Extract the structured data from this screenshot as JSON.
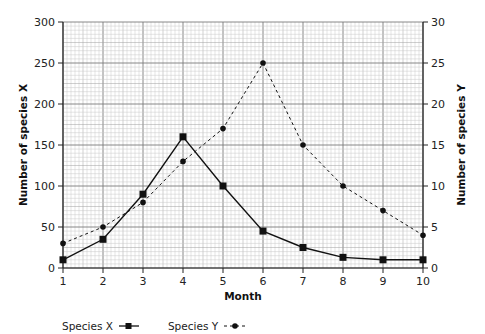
{
  "chart_data": {
    "type": "line",
    "title": "",
    "xlabel": "Month",
    "ylabel": "Number of species X",
    "ylabel_right": "Number of species Y",
    "x": [
      1,
      2,
      3,
      4,
      5,
      6,
      7,
      8,
      9,
      10
    ],
    "xlim": [
      1,
      10
    ],
    "ylim": [
      0,
      300
    ],
    "ylim_right": [
      0,
      30
    ],
    "x_ticks": [
      "1",
      "2",
      "3",
      "4",
      "5",
      "6",
      "7",
      "8",
      "9",
      "10"
    ],
    "y_ticks_left": [
      "0",
      "50",
      "100",
      "150",
      "200",
      "250",
      "300"
    ],
    "y_ticks_right": [
      "0",
      "5",
      "10",
      "15",
      "20",
      "25",
      "30"
    ],
    "grid": "graph-paper (major + minor)",
    "legend_position": "bottom-left",
    "series": [
      {
        "name": "Species X",
        "axis": "left",
        "style": "solid line, square markers",
        "values": [
          10,
          35,
          90,
          160,
          100,
          45,
          25,
          13,
          10,
          10
        ]
      },
      {
        "name": "Species Y",
        "axis": "right",
        "style": "dashed line, circle markers",
        "values": [
          3,
          5,
          8,
          13,
          17,
          25,
          15,
          10,
          7,
          4
        ]
      }
    ]
  },
  "labels": {
    "x_axis_title": "Month",
    "y_axis_left_title": "Number of species X",
    "y_axis_right_title": "Number of species Y"
  },
  "legend": {
    "items": [
      {
        "label": "Species X",
        "marker": "square-solid-line"
      },
      {
        "label": "Species Y",
        "marker": "circle-dashed-line"
      }
    ]
  },
  "colors": {
    "line": "#111111",
    "grid_minor": "#c8c8c8",
    "grid_major": "#7a7a7a",
    "background": "#ffffff"
  }
}
